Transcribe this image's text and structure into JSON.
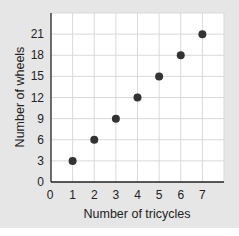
{
  "chart_data": {
    "type": "scatter",
    "title": "",
    "xlabel": "Number of tricycles",
    "ylabel": "Number of wheels",
    "x": [
      1,
      2,
      3,
      4,
      5,
      6,
      7
    ],
    "y": [
      3,
      6,
      9,
      12,
      15,
      18,
      21
    ],
    "xticks": [
      "0",
      "1",
      "2",
      "3",
      "4",
      "5",
      "6",
      "7"
    ],
    "yticks": [
      "0",
      "3",
      "6",
      "9",
      "12",
      "15",
      "18",
      "21"
    ],
    "xlim": [
      0,
      8
    ],
    "ylim": [
      0,
      24
    ],
    "grid": true,
    "legend": null,
    "colors": {
      "point": "#333333",
      "grid": "#d9d9d9",
      "panel": "#e6e6e6",
      "plot_bg": "#ffffff",
      "axis": "#222222"
    }
  }
}
